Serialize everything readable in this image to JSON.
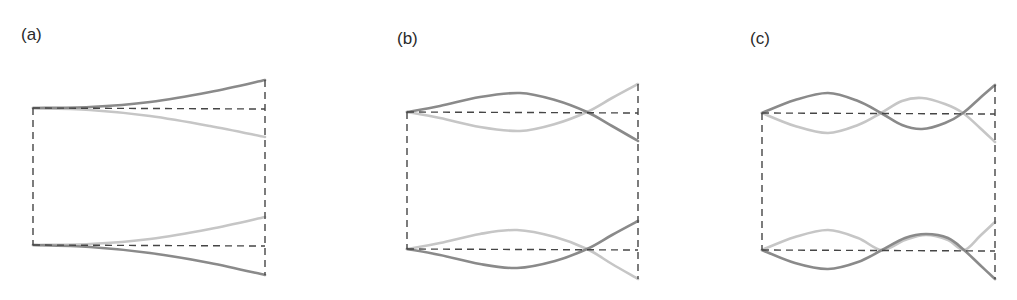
{
  "figure": {
    "panels": [
      {
        "id": "a",
        "label": "(a)",
        "label_pos": [
          21,
          26
        ],
        "frame": {
          "left": 33,
          "right": 265,
          "top": 108,
          "bottom": 245
        },
        "top_curves": {
          "dark": [
            [
              33,
              108
            ],
            [
              90,
              107
            ],
            [
              150,
              102
            ],
            [
              210,
              92
            ],
            [
              265,
              80
            ]
          ],
          "light": [
            [
              33,
              108
            ],
            [
              90,
              110
            ],
            [
              150,
              116
            ],
            [
              210,
              126
            ],
            [
              265,
              137
            ]
          ]
        },
        "bottom_curves": {
          "light": [
            [
              33,
              245
            ],
            [
              90,
              244
            ],
            [
              150,
              239
            ],
            [
              210,
              229
            ],
            [
              265,
              217
            ]
          ],
          "dark": [
            [
              33,
              245
            ],
            [
              90,
              247
            ],
            [
              150,
              253
            ],
            [
              210,
              263
            ],
            [
              265,
              275
            ]
          ]
        },
        "top_baseline_end": 109,
        "bottom_baseline_end": 246
      },
      {
        "id": "b",
        "label": "(b)",
        "label_pos": [
          397,
          30
        ],
        "frame": {
          "left": 407,
          "right": 638,
          "top": 112,
          "bottom": 249
        },
        "top_curves": {
          "dark": [
            [
              407,
              112
            ],
            [
              440,
              106
            ],
            [
              480,
              97
            ],
            [
              520,
              93
            ],
            [
              555,
              100
            ],
            [
              587,
              112
            ],
            [
              612,
              126
            ],
            [
              638,
              141
            ]
          ],
          "light": [
            [
              407,
              112
            ],
            [
              440,
              118
            ],
            [
              480,
              127
            ],
            [
              520,
              131
            ],
            [
              555,
              124
            ],
            [
              587,
              112
            ],
            [
              612,
              98
            ],
            [
              638,
              84
            ]
          ]
        },
        "bottom_curves": {
          "light": [
            [
              407,
              249
            ],
            [
              440,
              243
            ],
            [
              480,
              234
            ],
            [
              517,
              230
            ],
            [
              555,
              237
            ],
            [
              587,
              249
            ],
            [
              612,
              264
            ],
            [
              638,
              279
            ]
          ],
          "dark": [
            [
              407,
              249
            ],
            [
              440,
              255
            ],
            [
              480,
              264
            ],
            [
              517,
              268
            ],
            [
              555,
              261
            ],
            [
              587,
              249
            ],
            [
              612,
              235
            ],
            [
              638,
              221
            ]
          ]
        },
        "top_baseline_end": 113,
        "bottom_baseline_end": 250
      },
      {
        "id": "c",
        "label": "(c)",
        "label_pos": [
          750,
          30
        ],
        "frame": {
          "left": 762,
          "right": 995,
          "top": 113,
          "bottom": 250
        },
        "top_curves": {
          "dark": [
            [
              762,
              113
            ],
            [
              795,
              100
            ],
            [
              828,
              93
            ],
            [
              858,
              101
            ],
            [
              881,
              113
            ],
            [
              902,
              125
            ],
            [
              922,
              129
            ],
            [
              945,
              123
            ],
            [
              963,
              113
            ],
            [
              980,
              98
            ],
            [
              995,
              85
            ]
          ],
          "light": [
            [
              762,
              113
            ],
            [
              795,
              126
            ],
            [
              828,
              133
            ],
            [
              858,
              125
            ],
            [
              881,
              113
            ],
            [
              902,
              101
            ],
            [
              922,
              98
            ],
            [
              945,
              104
            ],
            [
              963,
              113
            ],
            [
              980,
              128
            ],
            [
              995,
              142
            ]
          ]
        },
        "bottom_curves": {
          "light": [
            [
              762,
              250
            ],
            [
              795,
              237
            ],
            [
              828,
              230
            ],
            [
              858,
              238
            ],
            [
              882,
              250
            ],
            [
              905,
              240
            ],
            [
              926,
              235
            ],
            [
              948,
              240
            ],
            [
              964,
              250
            ],
            [
              980,
              236
            ],
            [
              995,
              222
            ]
          ],
          "dark": [
            [
              762,
              250
            ],
            [
              795,
              263
            ],
            [
              828,
              269
            ],
            [
              858,
              262
            ],
            [
              882,
              250
            ],
            [
              905,
              238
            ],
            [
              926,
              234
            ],
            [
              948,
              238
            ],
            [
              964,
              250
            ],
            [
              980,
              265
            ],
            [
              995,
              279
            ]
          ]
        },
        "top_baseline_end": 114,
        "bottom_baseline_end": 251
      }
    ],
    "colors": {
      "dark_curve": "#8a8a8a",
      "light_curve": "#c6c6c6",
      "dashed": "#454545"
    }
  }
}
